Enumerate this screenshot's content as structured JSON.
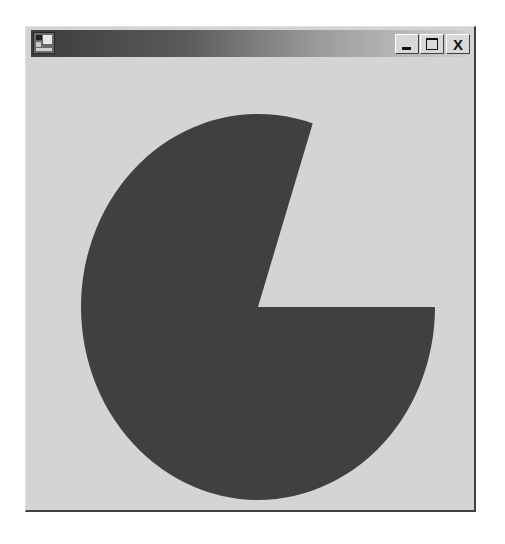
{
  "window": {
    "title": "",
    "buttons": {
      "minimize": "_",
      "maximize": "",
      "close": "X"
    },
    "colors": {
      "client_background": "#d4d4d4",
      "titlebar_start": "#3c3c3c",
      "titlebar_end": "#cfcfcf"
    }
  },
  "shape": {
    "type": "pie",
    "fill": "#404040",
    "center": [
      258,
      307
    ],
    "radius_x": 177,
    "radius_y": 193,
    "missing_slice_start_deg": 0,
    "missing_slice_end_deg": 72
  }
}
